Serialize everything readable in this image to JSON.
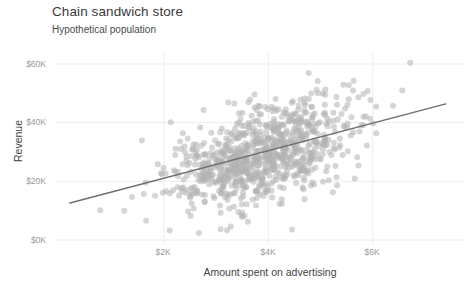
{
  "chart_data": {
    "type": "scatter",
    "title": "Chain sandwich store",
    "subtitle": "Hypothetical population",
    "xlabel": "Amount spent on advertising",
    "ylabel": "Revenue",
    "grid": true,
    "legend": null,
    "xlim": [
      0,
      7900
    ],
    "ylim": [
      0,
      64000
    ],
    "xticks": [
      2000,
      4000,
      6000
    ],
    "xticklabels": [
      "$2K",
      "$4K",
      "$6K"
    ],
    "yticks": [
      0,
      20000,
      40000,
      60000
    ],
    "yticklabels": [
      "$0K",
      "$20K",
      "$40K",
      "$60K"
    ],
    "point_color": "#b3b3b3",
    "point_opacity": 0.55,
    "point_size": 6,
    "n_points": 900,
    "correlation": 0.55,
    "x_mean": 3900,
    "x_sd": 900,
    "y_mean": 29000,
    "y_sd": 9500,
    "trendline": {
      "type": "linear",
      "color": "#6e6e6e",
      "width": 1.5,
      "x0": 200,
      "y0": 12600,
      "x1": 7400,
      "y1": 46400,
      "slope": 4.7,
      "intercept": 11660
    },
    "series": [
      {
        "name": "Stores",
        "points_note": "900 simulated stores; bivariate normal, x ~ N(3900, 900), y ~ N(29000, 9500), r = 0.55"
      }
    ]
  },
  "axes": {
    "y": {
      "label": "Revenue",
      "ticks": [
        {
          "label": "$60K",
          "value": 60000
        },
        {
          "label": "$40K",
          "value": 40000
        },
        {
          "label": "$20K",
          "value": 20000
        },
        {
          "label": "$0K",
          "value": 0
        }
      ]
    },
    "x": {
      "label": "Amount spent on advertising",
      "ticks": [
        {
          "label": "$2K",
          "value": 2000
        },
        {
          "label": "$4K",
          "value": 4000
        },
        {
          "label": "$6K",
          "value": 6000
        }
      ]
    }
  },
  "colors": {
    "background": "#ffffff",
    "grid": "#ededed",
    "point": "#b3b3b3",
    "trend": "#6e6e6e",
    "title_text": "#3a3a3a",
    "tick_text": "#9a9a9a"
  }
}
